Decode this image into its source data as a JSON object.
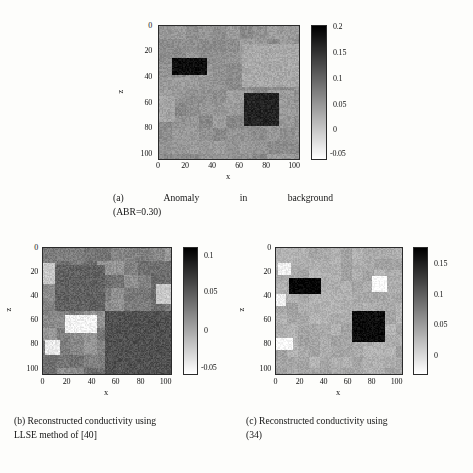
{
  "figure": {
    "background": "#fdfdfb",
    "panels": [
      {
        "id": "a",
        "caption_lines": [
          "(a)  Anomaly  in  background",
          "(ABR=0.30)"
        ],
        "caption_full": "(a) Anomaly in background (ABR=0.30)",
        "xlabel": "x",
        "ylabel": "z",
        "xticks": [
          "0",
          "20",
          "40",
          "60",
          "80",
          "100"
        ],
        "yticks": [
          "0",
          "20",
          "40",
          "60",
          "80",
          "100"
        ],
        "xlim": [
          0,
          104
        ],
        "ylim": [
          0,
          104
        ],
        "colorbar": {
          "ticks": [
            "0.2",
            "0.15",
            "0.1",
            "0.05",
            "0",
            "-0.05"
          ],
          "tickvalues": [
            0.2,
            0.15,
            0.1,
            0.05,
            0,
            -0.05
          ],
          "vmin": -0.062,
          "vmax": 0.212
        },
        "chart_data": {
          "type": "heatmap",
          "title": "",
          "xlabel": "x",
          "ylabel": "z",
          "colormap": "gray-inverted",
          "background_level": 0.055,
          "noise": 0.016,
          "block_size": 10,
          "block_noise": 0.012,
          "regions": [
            {
              "name": "anomaly-upper-left",
              "x0": 10,
              "x1": 36,
              "z0": 25,
              "z1": 38,
              "value": 0.198
            },
            {
              "name": "anomaly-lower-right",
              "x0": 63,
              "x1": 89,
              "z0": 52,
              "z1": 78,
              "value": 0.175
            },
            {
              "name": "bright-patch-right",
              "x0": 80,
              "x1": 90,
              "z0": 24,
              "z1": 36,
              "value": -0.042
            },
            {
              "name": "light-band-right",
              "x0": 62,
              "x1": 104,
              "z0": 14,
              "z1": 48,
              "value": 0.032
            },
            {
              "name": "light-band-left",
              "x0": 0,
              "x1": 12,
              "z0": 55,
              "z1": 75,
              "value": 0.036
            }
          ]
        }
      },
      {
        "id": "b",
        "caption_lines": [
          "(b) Reconstructed conductivity using",
          "LLSE method of [40]"
        ],
        "caption_full": "(b) Reconstructed conductivity using LLSE method of [40]",
        "xlabel": "x",
        "ylabel": "z",
        "xticks": [
          "0",
          "20",
          "40",
          "60",
          "80",
          "100"
        ],
        "yticks": [
          "0",
          "20",
          "40",
          "60",
          "80",
          "100"
        ],
        "xlim": [
          0,
          104
        ],
        "ylim": [
          0,
          104
        ],
        "colorbar": {
          "ticks": [
            "0.1",
            "0.05",
            "0",
            "-0.05"
          ],
          "tickvalues": [
            0.1,
            0.05,
            0,
            -0.05
          ],
          "vmin": -0.072,
          "vmax": 0.118
        },
        "chart_data": {
          "type": "heatmap",
          "title": "",
          "xlabel": "x",
          "ylabel": "z",
          "colormap": "gray-inverted",
          "background_level": 0.022,
          "noise": 0.013,
          "block_size": 11,
          "block_noise": 0.017,
          "regions": [
            {
              "name": "recon-anomaly-upper-left",
              "x0": 11,
              "x1": 48,
              "z0": 22,
              "z1": 40,
              "value": 0.105
            },
            {
              "name": "recon-anomaly-lower-right",
              "x0": 50,
              "x1": 104,
              "z0": 52,
              "z1": 104,
              "value": 0.058
            },
            {
              "name": "recon-halo-upper-left",
              "x0": 10,
              "x1": 50,
              "z0": 14,
              "z1": 52,
              "value": 0.046
            },
            {
              "name": "bright-lower-middle",
              "x0": 18,
              "x1": 44,
              "z0": 55,
              "z1": 70,
              "value": -0.062
            },
            {
              "name": "bright-left-low",
              "x0": 2,
              "x1": 14,
              "z0": 76,
              "z1": 88,
              "value": -0.055
            },
            {
              "name": "light-left-top",
              "x0": 0,
              "x1": 10,
              "z0": 12,
              "z1": 30,
              "value": -0.03
            },
            {
              "name": "light-right-mid",
              "x0": 92,
              "x1": 104,
              "z0": 30,
              "z1": 46,
              "value": -0.03
            }
          ]
        }
      },
      {
        "id": "c",
        "caption_lines": [
          "(c) Reconstructed conductivity using",
          "(34)"
        ],
        "caption_full": "(c) Reconstructed conductivity using (34)",
        "xlabel": "x",
        "ylabel": "z",
        "xticks": [
          "0",
          "20",
          "40",
          "60",
          "80",
          "100"
        ],
        "yticks": [
          "0",
          "20",
          "40",
          "60",
          "80",
          "100"
        ],
        "xlim": [
          0,
          104
        ],
        "ylim": [
          0,
          104
        ],
        "colorbar": {
          "ticks": [
            "0.15",
            "0.1",
            "0.05",
            "0"
          ],
          "tickvalues": [
            0.15,
            0.1,
            0.05,
            0
          ],
          "vmin": -0.028,
          "vmax": 0.182
        },
        "chart_data": {
          "type": "heatmap",
          "title": "",
          "xlabel": "x",
          "ylabel": "z",
          "colormap": "gray-inverted",
          "background_level": 0.042,
          "noise": 0.012,
          "block_size": 9,
          "block_noise": 0.009,
          "regions": [
            {
              "name": "recon-anomaly-upper-left",
              "x0": 11,
              "x1": 37,
              "z0": 25,
              "z1": 38,
              "value": 0.178
            },
            {
              "name": "recon-anomaly-lower-right",
              "x0": 63,
              "x1": 90,
              "z0": 52,
              "z1": 78,
              "value": 0.172
            },
            {
              "name": "bright-patch-right",
              "x0": 79,
              "x1": 92,
              "z0": 23,
              "z1": 36,
              "value": -0.024
            },
            {
              "name": "bright-patch-left-low",
              "x0": 0,
              "x1": 14,
              "z0": 74,
              "z1": 84,
              "value": -0.022
            },
            {
              "name": "bright-patch-left-mid",
              "x0": 0,
              "x1": 8,
              "z0": 38,
              "z1": 48,
              "value": -0.016
            },
            {
              "name": "bright-patch-left-top",
              "x0": 2,
              "x1": 12,
              "z0": 12,
              "z1": 22,
              "value": -0.014
            }
          ]
        }
      }
    ]
  }
}
